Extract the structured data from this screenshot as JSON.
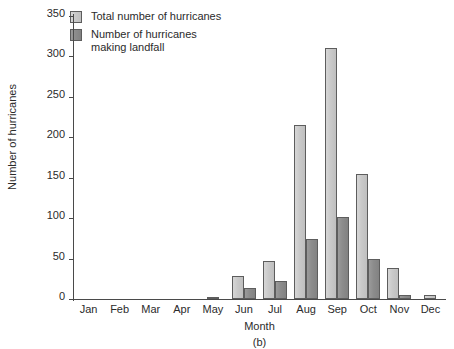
{
  "chart_data": {
    "type": "bar",
    "title": "",
    "subtitle": "",
    "xlabel": "Month",
    "ylabel": "Number of hurricanes",
    "caption": "(b)",
    "categories": [
      "Jan",
      "Feb",
      "Mar",
      "Apr",
      "May",
      "Jun",
      "Jul",
      "Aug",
      "Sep",
      "Oct",
      "Nov",
      "Dec"
    ],
    "series": [
      {
        "name": "Total number of hurricanes",
        "color": "#c9c9c9",
        "values": [
          0,
          0,
          0,
          0,
          3,
          28,
          47,
          215,
          311,
          155,
          38,
          5
        ]
      },
      {
        "name": "Number of hurricanes\nmaking landfall",
        "color": "#8c8c8c",
        "values": [
          0,
          0,
          0,
          0,
          0,
          14,
          22,
          74,
          102,
          50,
          5,
          0
        ]
      }
    ],
    "ylim": [
      0,
      350
    ],
    "yticks": [
      0,
      50,
      100,
      150,
      200,
      250,
      300,
      350
    ],
    "grid": false,
    "legend_position": "top-left"
  },
  "legend": {
    "items": [
      {
        "label": "Total number of hurricanes",
        "swatch": "legend-swatch-total"
      },
      {
        "label": "Number of hurricanes\nmaking landfall",
        "swatch": "legend-swatch-landfall"
      }
    ]
  }
}
